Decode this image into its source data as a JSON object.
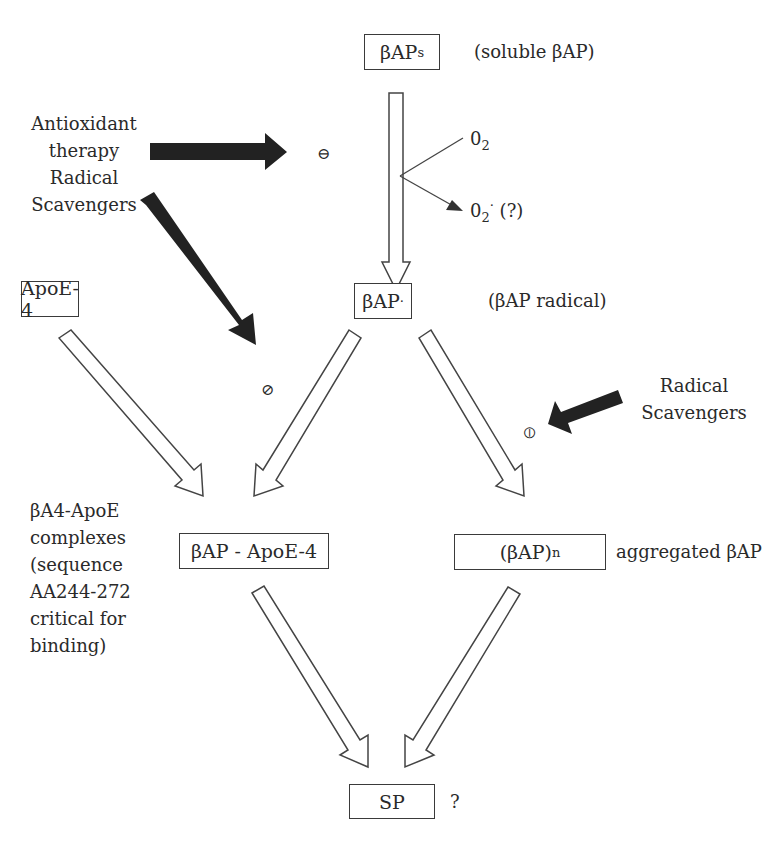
{
  "nodes": {
    "bap_s": {
      "main": "βAP",
      "sub": "s",
      "note": "(soluble βAP)"
    },
    "bap_radical": {
      "main": "βAP",
      "sup": "·",
      "note": "(βAP radical)"
    },
    "apoe4": {
      "label": "ApoE-4"
    },
    "bap_apoe4": {
      "label": "βAP - ApoE-4"
    },
    "bap_n": {
      "main": "(βAP)",
      "sub": "n",
      "note": "aggregated βAP"
    },
    "sp": {
      "label": "SP",
      "note": "?"
    }
  },
  "side_labels": {
    "antioxidant": [
      "Antioxidant",
      "therapy",
      "Radical",
      "Scavengers"
    ],
    "radical_scavengers": [
      "Radical",
      "Scavengers"
    ],
    "complexes": [
      "βA4-ApoE",
      "complexes",
      "(sequence",
      "AA244-272",
      "critical for",
      "binding)"
    ]
  },
  "oxygen": {
    "o2": "0",
    "o2_sub": "2",
    "o2_radical": "0",
    "o2_radical_sub": "2",
    "o2_radical_sup": "·",
    "o2_radical_note": "(?)"
  },
  "inhibition_symbols": {
    "top": "⊖",
    "left": "⊘",
    "right": "⦶"
  }
}
